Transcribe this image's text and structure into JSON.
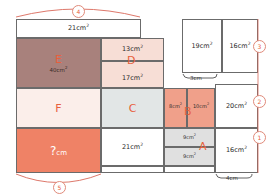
{
  "diagram": {
    "colors": {
      "brown": "#a8817c",
      "pink_light": "#f7ded6",
      "pink_pale": "#fbeeea",
      "gray_blue": "#e2e6e6",
      "salmon": "#ef8266",
      "salmon_light": "#f0a08a",
      "gray_light": "#e0e0e0",
      "accent": "#e8603c",
      "marker_ring": "#e08a7a",
      "line": "#6b6b6b"
    },
    "regions": {
      "top_strip": {
        "area": "21cm",
        "sup": "2"
      },
      "E": {
        "letter": "E",
        "area": "40cm",
        "sup": "2"
      },
      "D": {
        "letter": "D",
        "area_top": "13cm",
        "area_bottom": "17cm",
        "sup": "2"
      },
      "F": {
        "letter": "F"
      },
      "C": {
        "letter": "C"
      },
      "C_below": {
        "area": "21cm",
        "sup": "2"
      },
      "unknown": {
        "value": "?",
        "unit": "cm"
      },
      "B": {
        "letter": "B",
        "area_left": "8cm",
        "area_right": "10cm",
        "sup": "2"
      },
      "A": {
        "letter": "A",
        "area_top": "9cm",
        "area_bottom": "9cm",
        "sup": "2"
      },
      "top_right_1": {
        "area": "19cm",
        "sup": "2"
      },
      "top_right_2": {
        "area": "16cm",
        "sup": "2"
      },
      "mid_right": {
        "area": "20cm",
        "sup": "2"
      },
      "bottom_right": {
        "area": "16cm",
        "sup": "2"
      }
    },
    "markers": {
      "m1": "1",
      "m2": "2",
      "m3": "3",
      "m4": "4",
      "m5": "5"
    },
    "dimensions": {
      "brace_3cm": "3cm",
      "brace_4cm": "4cm"
    }
  }
}
